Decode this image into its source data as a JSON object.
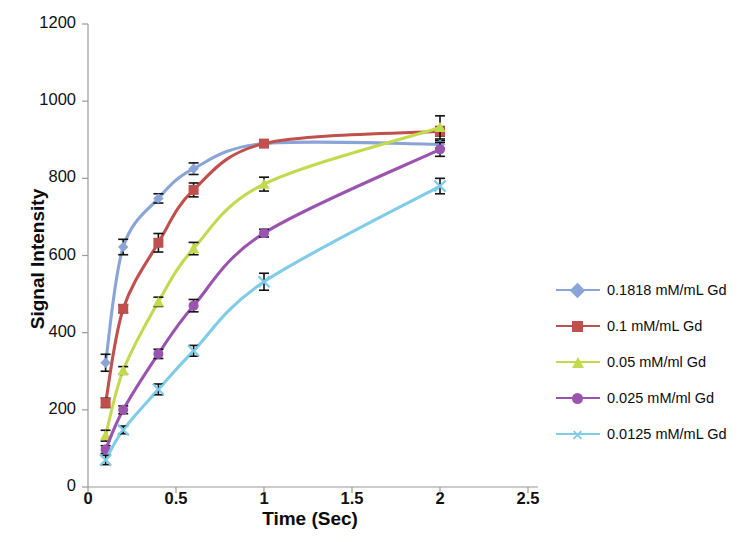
{
  "chart_data": {
    "type": "line",
    "title": "",
    "xlabel": "Time (Sec)",
    "ylabel": "Signal Intensity",
    "xlim": [
      0,
      2.5
    ],
    "ylim": [
      0,
      1200
    ],
    "xticks": [
      "0",
      "0.5",
      "1",
      "1.5",
      "2",
      "2.5"
    ],
    "xtick_values": [
      0,
      0.5,
      1,
      1.5,
      2,
      2.5
    ],
    "yticks": [
      "0",
      "200",
      "400",
      "600",
      "800",
      "1000",
      "1200"
    ],
    "ytick_values": [
      0,
      200,
      400,
      600,
      800,
      1000,
      1200
    ],
    "grid": false,
    "legend_position": "right",
    "x": [
      0.1,
      0.2,
      0.4,
      0.6,
      1.0,
      2.0
    ],
    "series": [
      {
        "name": "0.1818 mM/mL Gd",
        "color": "#8ba4d8",
        "marker": "diamond",
        "values": [
          322,
          622,
          748,
          825,
          890,
          888
        ],
        "errors": [
          22,
          20,
          12,
          15,
          8,
          10
        ]
      },
      {
        "name": "0.1 mM/mL Gd",
        "color": "#c0504d",
        "marker": "square",
        "values": [
          218,
          462,
          633,
          770,
          890,
          922
        ],
        "errors": [
          12,
          10,
          24,
          18,
          8,
          12
        ]
      },
      {
        "name": "0.05 mM/ml Gd",
        "color": "#c3d94e",
        "marker": "triangle",
        "values": [
          133,
          302,
          480,
          618,
          785,
          932
        ],
        "errors": [
          14,
          10,
          12,
          16,
          18,
          30
        ]
      },
      {
        "name": "0.025 mM/ml Gd",
        "color": "#9a54b0",
        "marker": "circle",
        "values": [
          97,
          200,
          345,
          470,
          658,
          875
        ],
        "errors": [
          10,
          10,
          12,
          16,
          10,
          18
        ]
      },
      {
        "name": "0.0125 mM/mL Gd",
        "color": "#7fcce8",
        "marker": "x",
        "values": [
          70,
          148,
          253,
          353,
          532,
          780
        ],
        "errors": [
          12,
          10,
          14,
          14,
          22,
          20
        ]
      }
    ]
  }
}
